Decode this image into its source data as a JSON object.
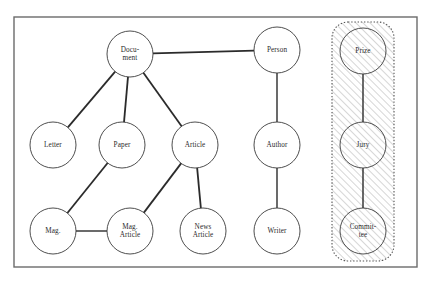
{
  "diagram": {
    "type": "node-link-graph",
    "frame": {
      "x": 14,
      "y": 17,
      "width": 403,
      "height": 250,
      "stroke_color": "#6b6b6b"
    },
    "group": {
      "name": "hatched-group",
      "label": "",
      "x": 332,
      "y": 22,
      "width": 62,
      "height": 239,
      "corner_radius": 16,
      "fill_style": "diagonal-hatch",
      "border_style": "dotted",
      "hatch_color": "#9a9a9a",
      "border_color": "#555555",
      "members": [
        "prize",
        "jury",
        "committee"
      ]
    },
    "node_radius": 23,
    "nodes": [
      {
        "id": "document",
        "lines": [
          "Docu-",
          "ment"
        ],
        "cx": 130,
        "cy": 54,
        "in_group": false
      },
      {
        "id": "person",
        "lines": [
          "Person"
        ],
        "cx": 277,
        "cy": 50,
        "in_group": false
      },
      {
        "id": "prize",
        "lines": [
          "Prize"
        ],
        "cx": 363,
        "cy": 51,
        "in_group": true
      },
      {
        "id": "letter",
        "lines": [
          "Letter"
        ],
        "cx": 53,
        "cy": 145,
        "in_group": false
      },
      {
        "id": "paper",
        "lines": [
          "Paper"
        ],
        "cx": 122,
        "cy": 145,
        "in_group": false
      },
      {
        "id": "article",
        "lines": [
          "Article"
        ],
        "cx": 195,
        "cy": 145,
        "in_group": false
      },
      {
        "id": "author",
        "lines": [
          "Author"
        ],
        "cx": 277,
        "cy": 145,
        "in_group": false
      },
      {
        "id": "jury",
        "lines": [
          "Jury"
        ],
        "cx": 363,
        "cy": 145,
        "in_group": true
      },
      {
        "id": "mag",
        "lines": [
          "Mag."
        ],
        "cx": 53,
        "cy": 231,
        "in_group": false
      },
      {
        "id": "mag_article",
        "lines": [
          "Mag.",
          "Article"
        ],
        "cx": 130,
        "cy": 231,
        "in_group": false
      },
      {
        "id": "news_article",
        "lines": [
          "News",
          "Article"
        ],
        "cx": 203,
        "cy": 231,
        "in_group": false
      },
      {
        "id": "writer",
        "lines": [
          "Writer"
        ],
        "cx": 277,
        "cy": 231,
        "in_group": false
      },
      {
        "id": "committee",
        "lines": [
          "Commit-",
          "tee"
        ],
        "cx": 363,
        "cy": 231,
        "in_group": true
      }
    ],
    "edges": [
      {
        "from": "document",
        "to": "person",
        "weight": "thick"
      },
      {
        "from": "document",
        "to": "letter",
        "weight": "thick"
      },
      {
        "from": "document",
        "to": "paper",
        "weight": "thick"
      },
      {
        "from": "document",
        "to": "article",
        "weight": "thick"
      },
      {
        "from": "paper",
        "to": "mag",
        "weight": "thick"
      },
      {
        "from": "article",
        "to": "mag_article",
        "weight": "thick"
      },
      {
        "from": "article",
        "to": "news_article",
        "weight": "thick"
      },
      {
        "from": "mag",
        "to": "mag_article",
        "weight": "thin"
      },
      {
        "from": "person",
        "to": "author",
        "weight": "thin"
      },
      {
        "from": "author",
        "to": "writer",
        "weight": "thin"
      },
      {
        "from": "prize",
        "to": "jury",
        "weight": "thin"
      },
      {
        "from": "jury",
        "to": "committee",
        "weight": "thin"
      }
    ]
  }
}
